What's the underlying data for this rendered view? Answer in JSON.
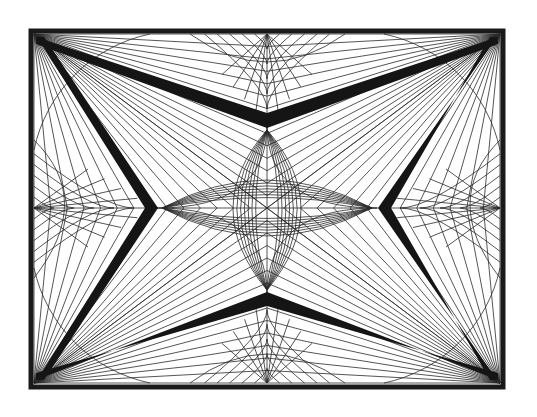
{
  "artwork": {
    "kind": "geometric string-art line drawing",
    "colors": {
      "background": "#ffffff",
      "ink": "#151515"
    },
    "frame": {
      "x": 31,
      "y": 31,
      "width": 472,
      "height": 356,
      "stroke": 5
    },
    "center": [
      267,
      208
    ],
    "corners": [
      [
        34,
        34
      ],
      [
        500,
        34
      ],
      [
        500,
        383
      ],
      [
        34,
        383
      ]
    ],
    "edge_foci": {
      "top": [
        267,
        34
      ],
      "bottom": [
        267,
        383
      ],
      "left": [
        34,
        208
      ],
      "right": [
        500,
        208
      ]
    },
    "chevron_tips": {
      "top": [
        267,
        125
      ],
      "bottom": [
        267,
        295
      ],
      "left": [
        157,
        208
      ],
      "right": [
        378,
        208
      ]
    },
    "rays_per_corner": 14,
    "web_rings": 5
  }
}
